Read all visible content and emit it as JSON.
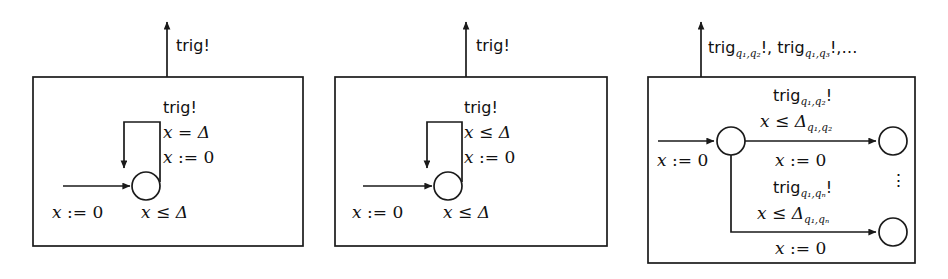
{
  "figure": {
    "type": "timed-automata-diagram",
    "panel_count": 3,
    "stroke_color": "#1a1a1a",
    "background": "#ffffff"
  },
  "panels": [
    {
      "id": "panel-1",
      "external_output": "trig!",
      "self_loop": {
        "sync": "trig!",
        "guard_var": "x",
        "guard_op": "=",
        "guard_bound": "Δ",
        "reset_var": "x",
        "reset_op": ":=",
        "reset_value": "0"
      },
      "entry_reset": {
        "var": "x",
        "op": ":=",
        "value": "0"
      },
      "invariant": {
        "var": "x",
        "op": "≤",
        "bound": "Δ"
      }
    },
    {
      "id": "panel-2",
      "external_output": "trig!",
      "self_loop": {
        "sync": "trig!",
        "guard_var": "x",
        "guard_op": "≤",
        "guard_bound": "Δ",
        "reset_var": "x",
        "reset_op": ":=",
        "reset_value": "0"
      },
      "entry_reset": {
        "var": "x",
        "op": ":=",
        "value": "0"
      },
      "invariant": {
        "var": "x",
        "op": "≤",
        "bound": "Δ"
      }
    },
    {
      "id": "panel-3",
      "external_output": {
        "first_name": "trig",
        "first_sub": "q₁,q₂",
        "first_bang": "!,",
        "second_name": "trig",
        "second_sub": "q₁,q₃",
        "second_bang": "!,",
        "ellipsis": "…"
      },
      "entry_reset": {
        "var": "x",
        "op": ":=",
        "value": "0"
      },
      "transitions": [
        {
          "id": "transition-upper",
          "sync_name": "trig",
          "sync_sub": "q₁,q₂",
          "sync_bang": "!",
          "guard_var": "x",
          "guard_op": "≤",
          "guard_bound": "Δ",
          "guard_bound_sub": "q₁,q₂",
          "reset_var": "x",
          "reset_op": ":=",
          "reset_value": "0"
        },
        {
          "id": "transition-lower",
          "sync_name": "trig",
          "sync_sub": "q₁,qₙ",
          "sync_bang": "!",
          "guard_var": "x",
          "guard_op": "≤",
          "guard_bound": "Δ",
          "guard_bound_sub": "q₁,qₙ",
          "reset_var": "x",
          "reset_op": ":=",
          "reset_value": "0"
        }
      ],
      "vertical_ellipsis": "⋮"
    }
  ]
}
